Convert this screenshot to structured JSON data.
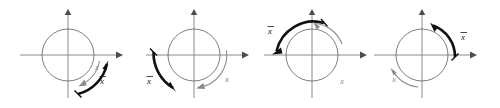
{
  "figure": {
    "panel_count": 4,
    "background_color": "#ffffff",
    "axis_color": "#8a8a8a",
    "circle_color": "#6e6e6e",
    "gray_arrow_color": "#8c8c8c",
    "black_arrow_color": "#111111"
  },
  "panels": [
    {
      "id": "panel-1",
      "center": {
        "x": 68,
        "y": 55
      },
      "radius": 26,
      "labels": {
        "x": {
          "text": "x",
          "color": "gray",
          "x": 97,
          "y": 68
        },
        "xbar": {
          "text": "x",
          "overbar": true,
          "color": "black",
          "x": 102,
          "y": 82
        }
      },
      "arcs": {
        "gray": {
          "start_deg": -22,
          "end_deg": -68,
          "radius": 33,
          "direction": "clockwise-inward"
        },
        "black": {
          "start_deg": -75,
          "end_deg": -12,
          "radius": 40,
          "direction": "counterclockwise-outward"
        }
      }
    },
    {
      "id": "panel-2",
      "center": {
        "x": 194,
        "y": 55
      },
      "radius": 26,
      "labels": {
        "xbar": {
          "text": "x",
          "overbar": true,
          "color": "black",
          "x": 150,
          "y": 82
        },
        "x": {
          "text": "x",
          "color": "gray",
          "x": 227,
          "y": 80
        }
      },
      "arcs": {
        "black": {
          "start_deg": 182,
          "end_deg": 243,
          "radius": 41,
          "direction": "clockwise-down-left"
        },
        "gray": {
          "start_deg": 352,
          "end_deg": 268,
          "radius": 33,
          "direction": "clockwise-to-bottom"
        }
      }
    },
    {
      "id": "panel-3",
      "center": {
        "x": 312,
        "y": 55
      },
      "radius": 26,
      "labels": {
        "xbar": {
          "text": "x",
          "overbar": true,
          "color": "black",
          "x": 271,
          "y": 32
        },
        "x": {
          "text": "x",
          "color": "gray",
          "x": 342,
          "y": 82
        }
      },
      "arcs": {
        "black": {
          "start_deg": 108,
          "end_deg": 178,
          "radius": 38,
          "direction": "counterclockwise-to-left"
        },
        "gray": {
          "start_deg": 20,
          "end_deg": 86,
          "radius": 32,
          "direction": "counterclockwise-up"
        }
      }
    },
    {
      "id": "panel-4",
      "center": {
        "x": 422,
        "y": 55
      },
      "radius": 26,
      "labels": {
        "xbar": {
          "text": "x",
          "overbar": true,
          "color": "black",
          "x": 464,
          "y": 38
        },
        "x": {
          "text": "x",
          "color": "gray",
          "x": 394,
          "y": 80
        }
      },
      "arcs": {
        "black": {
          "start_deg": 5,
          "end_deg": 72,
          "radius": 33,
          "direction": "counterclockwise-up-left"
        },
        "gray": {
          "start_deg": 150,
          "end_deg": 200,
          "radius": 32,
          "direction": "clockwise-down"
        }
      }
    }
  ],
  "axes": {
    "x_axis_label": "",
    "y_axis_label": "",
    "x_half_length": 50,
    "y_half_length": 43
  }
}
